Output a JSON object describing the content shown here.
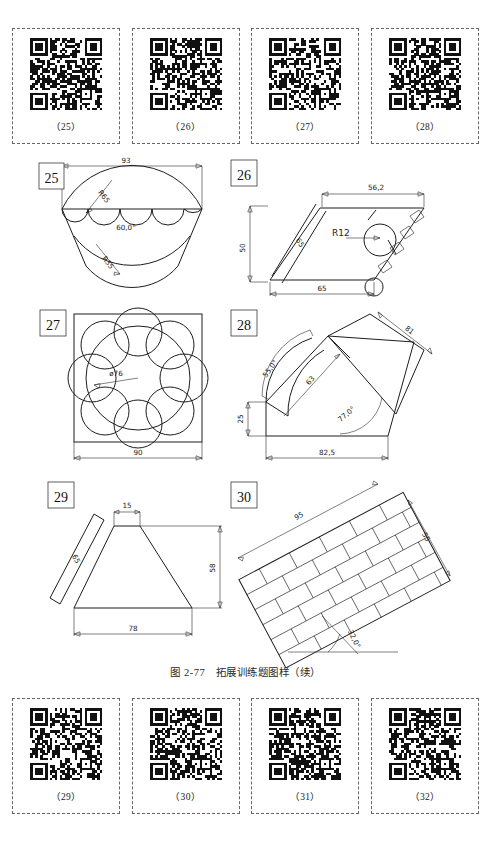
{
  "page": {
    "caption": "图 2-77　拓展训练题图样（续）",
    "width": 491,
    "height": 842,
    "background": "#ffffff",
    "line_color": "#1d1d1d"
  },
  "qr_rows": {
    "top": {
      "items": [
        {
          "label": "（25）",
          "icon": "qr-code-icon"
        },
        {
          "label": "（26）",
          "icon": "qr-code-icon"
        },
        {
          "label": "（27）",
          "icon": "qr-code-icon"
        },
        {
          "label": "（28）",
          "icon": "qr-code-icon"
        }
      ]
    },
    "bottom": {
      "items": [
        {
          "label": "（29）",
          "icon": "qr-code-icon"
        },
        {
          "label": "（30）",
          "icon": "qr-code-icon"
        },
        {
          "label": "（31）",
          "icon": "qr-code-icon"
        },
        {
          "label": "（32）",
          "icon": "qr-code-icon"
        }
      ]
    }
  },
  "figures": [
    {
      "number": "25",
      "description": "fan shape with three scallops and lower lens arc",
      "dimensions": [
        {
          "text": "93",
          "kind": "linear"
        },
        {
          "text": "R65",
          "kind": "radius"
        },
        {
          "text": "60,0°",
          "kind": "angle"
        },
        {
          "text": "R35",
          "kind": "radius"
        }
      ]
    },
    {
      "number": "26",
      "description": "slanted parallelogram plate with circular boss and hatched edge",
      "dimensions": [
        {
          "text": "56,2",
          "kind": "linear"
        },
        {
          "text": "50",
          "kind": "linear"
        },
        {
          "text": "65",
          "kind": "linear"
        },
        {
          "text": "65",
          "kind": "linear"
        },
        {
          "text": "R12",
          "kind": "radius"
        }
      ]
    },
    {
      "number": "27",
      "description": "flower rosette of eight circles around a central circle inside a square",
      "dimensions": [
        {
          "text": "ø76",
          "kind": "diameter"
        },
        {
          "text": "90",
          "kind": "linear"
        }
      ]
    },
    {
      "number": "28",
      "description": "angled wedge plate with curved slot",
      "dimensions": [
        {
          "text": "55,0°",
          "kind": "angle"
        },
        {
          "text": "63",
          "kind": "linear"
        },
        {
          "text": "81",
          "kind": "linear"
        },
        {
          "text": "77,0°",
          "kind": "angle"
        },
        {
          "text": "25",
          "kind": "linear"
        },
        {
          "text": "82,5",
          "kind": "linear"
        }
      ]
    },
    {
      "number": "29",
      "description": "isosceles trapezoid with slanted reference strip",
      "dimensions": [
        {
          "text": "15",
          "kind": "linear"
        },
        {
          "text": "65",
          "kind": "linear"
        },
        {
          "text": "58",
          "kind": "linear"
        },
        {
          "text": "78",
          "kind": "linear"
        }
      ]
    },
    {
      "number": "30",
      "description": "rotated rectangle filled with a running-bond brick pattern",
      "dimensions": [
        {
          "text": "95",
          "kind": "linear"
        },
        {
          "text": "55",
          "kind": "linear"
        },
        {
          "text": "32,0°",
          "kind": "angle"
        }
      ]
    }
  ]
}
